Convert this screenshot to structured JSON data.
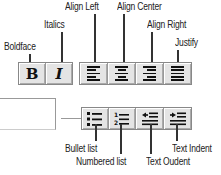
{
  "labels": {
    "boldface": "Boldface",
    "italics": "Italics",
    "align_left": "Align Left",
    "align_center": "Align Center",
    "align_right": "Align Right",
    "justify": "Justify",
    "bullet_list": "Bullet list",
    "numbered_list": "Numbered list",
    "text_outdent": "Text Oudent",
    "text_indent": "Text Indent"
  },
  "glyphs": {
    "bold": "B",
    "italic": "I",
    "num1": "1",
    "num2": "2"
  }
}
